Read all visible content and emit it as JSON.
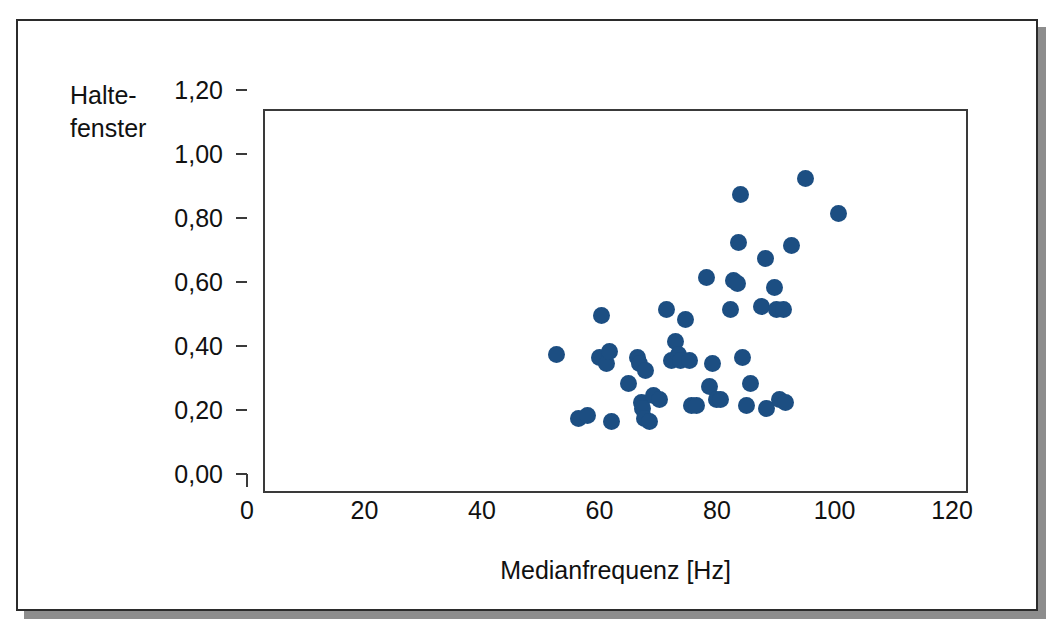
{
  "chart_data": {
    "type": "scatter",
    "title": "",
    "xlabel": "Medianfrequenz [Hz]",
    "ylabel": "Halte-\nfenster",
    "ylabel_lines": [
      "Halte-",
      "fenster"
    ],
    "xlim": [
      0,
      120
    ],
    "ylim": [
      0.0,
      1.2
    ],
    "xticks": [
      0,
      20,
      40,
      60,
      80,
      100,
      120
    ],
    "xtick_labels": [
      "0",
      "20",
      "40",
      "60",
      "80",
      "100",
      "120"
    ],
    "yticks": [
      0.0,
      0.2,
      0.4,
      0.6,
      0.8,
      1.0,
      1.2
    ],
    "ytick_labels": [
      "0,00",
      "0,20",
      "0,40",
      "0,60",
      "0,80",
      "1,00",
      "1,20"
    ],
    "grid": false,
    "legend": null,
    "marker_color": "#1c4e82",
    "marker_size_px": 17,
    "series": [
      {
        "name": "Messpunkte",
        "points": [
          [
            49.6,
            0.44
          ],
          [
            53.4,
            0.24
          ],
          [
            54.9,
            0.25
          ],
          [
            57.0,
            0.43
          ],
          [
            57.3,
            0.56
          ],
          [
            58.2,
            0.41
          ],
          [
            58.6,
            0.45
          ],
          [
            58.9,
            0.23
          ],
          [
            61.9,
            0.35
          ],
          [
            63.4,
            0.43
          ],
          [
            63.8,
            0.41
          ],
          [
            64.0,
            0.29
          ],
          [
            64.3,
            0.27
          ],
          [
            64.6,
            0.24
          ],
          [
            64.8,
            0.39
          ],
          [
            65.4,
            0.23
          ],
          [
            66.2,
            0.31
          ],
          [
            67.1,
            0.3
          ],
          [
            68.4,
            0.58
          ],
          [
            69.2,
            0.42
          ],
          [
            69.8,
            0.48
          ],
          [
            70.4,
            0.44
          ],
          [
            70.8,
            0.42
          ],
          [
            71.6,
            0.55
          ],
          [
            72.2,
            0.42
          ],
          [
            72.6,
            0.28
          ],
          [
            73.4,
            0.28
          ],
          [
            75.1,
            0.68
          ],
          [
            75.6,
            0.34
          ],
          [
            76.1,
            0.41
          ],
          [
            76.8,
            0.3
          ],
          [
            77.6,
            0.3
          ],
          [
            79.3,
            0.58
          ],
          [
            79.8,
            0.67
          ],
          [
            80.4,
            0.66
          ],
          [
            80.6,
            0.79
          ],
          [
            80.9,
            0.94
          ],
          [
            81.3,
            0.43
          ],
          [
            82.0,
            0.28
          ],
          [
            82.7,
            0.35
          ],
          [
            84.5,
            0.59
          ],
          [
            85.2,
            0.74
          ],
          [
            85.4,
            0.27
          ],
          [
            86.8,
            0.65
          ],
          [
            87.1,
            0.58
          ],
          [
            87.6,
            0.3
          ],
          [
            88.3,
            0.58
          ],
          [
            88.6,
            0.29
          ],
          [
            89.6,
            0.78
          ],
          [
            92.0,
            0.99
          ],
          [
            97.6,
            0.88
          ]
        ]
      }
    ]
  }
}
